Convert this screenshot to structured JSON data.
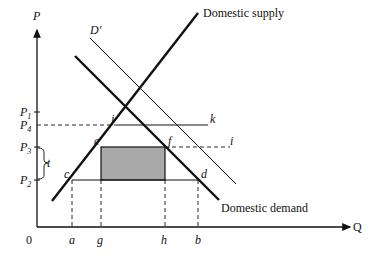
{
  "axes": {
    "y_label": "P",
    "x_label": "Q",
    "origin_label": "0"
  },
  "price_levels": [
    {
      "id": "P1",
      "label": "P",
      "sub": "1",
      "y": 112
    },
    {
      "id": "P4",
      "label": "P",
      "sub": "4",
      "y": 125
    },
    {
      "id": "P3",
      "label": "P",
      "sub": "3",
      "y": 147
    },
    {
      "id": "P2",
      "label": "P",
      "sub": "2",
      "y": 180
    }
  ],
  "tariff_label": "t",
  "quantity_ticks": [
    {
      "label": "a",
      "x": 72
    },
    {
      "label": "g",
      "x": 101
    },
    {
      "label": "h",
      "x": 165
    },
    {
      "label": "b",
      "x": 198
    }
  ],
  "curves": {
    "supply": {
      "label": "Domestic supply"
    },
    "demand": {
      "label": "Domestic demand"
    },
    "demand_shifted": {
      "label": "D′"
    }
  },
  "points": [
    {
      "label": "j",
      "x": 118,
      "y": 125
    },
    {
      "label": "k",
      "x": 208,
      "y": 125
    },
    {
      "label": "e",
      "x": 101,
      "y": 147
    },
    {
      "label": "f",
      "x": 165,
      "y": 147
    },
    {
      "label": "i",
      "x": 230,
      "y": 147
    },
    {
      "label": "c",
      "x": 72,
      "y": 180
    },
    {
      "label": "d",
      "x": 198,
      "y": 180
    }
  ],
  "colors": {
    "shaded_area": "#a9a9a9",
    "line": "#111111"
  }
}
